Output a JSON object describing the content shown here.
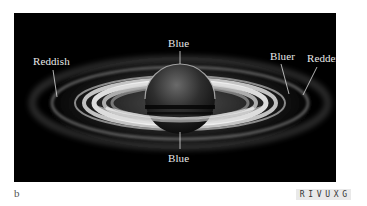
{
  "figure": {
    "panel_label": "b",
    "annotations": [
      {
        "id": "reddish",
        "text": "Reddish"
      },
      {
        "id": "blue_top",
        "text": "Blue"
      },
      {
        "id": "blue_bottom",
        "text": "Blue"
      },
      {
        "id": "bluer",
        "text": "Bluer"
      },
      {
        "id": "redder",
        "text": "Redder"
      }
    ],
    "wavelength_badge": {
      "letters": [
        "R",
        "I",
        "V",
        "U",
        "X",
        "G"
      ],
      "highlighted": "V"
    }
  },
  "colors": {
    "background": "#ffffff",
    "photo_background": "#000000",
    "label_text": "#e8e8e8",
    "badge_background": "#e9e9e9"
  }
}
